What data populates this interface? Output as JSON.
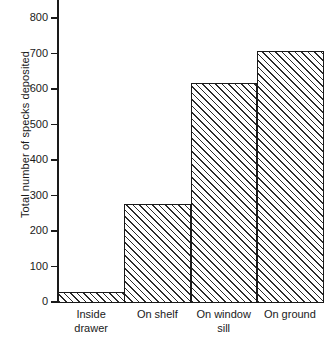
{
  "chart_data": {
    "type": "bar",
    "title": "",
    "subtitle": "",
    "xlabel": "",
    "ylabel": "Total number of specks deposited",
    "categories": [
      "Inside drawer",
      "On shelf",
      "On window sill",
      "On ground"
    ],
    "category_lines": [
      [
        "Inside",
        "drawer"
      ],
      [
        "On shelf",
        ""
      ],
      [
        "On window",
        "sill"
      ],
      [
        "On ground",
        ""
      ]
    ],
    "values": [
      28,
      275,
      618,
      708
    ],
    "ylim": [
      0,
      800
    ],
    "y_ticks": [
      0,
      100,
      200,
      300,
      400,
      500,
      600,
      700,
      800
    ],
    "y_tick_labels": [
      "0",
      "100",
      "200",
      "300",
      "400",
      "500",
      "600",
      "700",
      "800"
    ],
    "grid": false,
    "legend": null,
    "bar_style": "diagonal-hatch",
    "bars_contiguous": true,
    "colors": {
      "axis": "#1a1a1a",
      "bar_edge": "#1a1a1a",
      "bar_hatch": "#2b2b2b",
      "bar_fill": "#ffffff",
      "background": "#ffffff"
    }
  }
}
